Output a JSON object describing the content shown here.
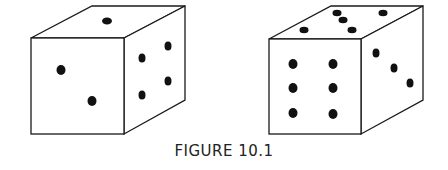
{
  "figure": {
    "caption": "FIGURE 10.1",
    "dice": [
      {
        "name": "die-left",
        "faces": {
          "top": 1,
          "front": 2,
          "right": 4
        }
      },
      {
        "name": "die-right",
        "faces": {
          "top": 5,
          "front": 6,
          "right": 3
        }
      }
    ]
  }
}
